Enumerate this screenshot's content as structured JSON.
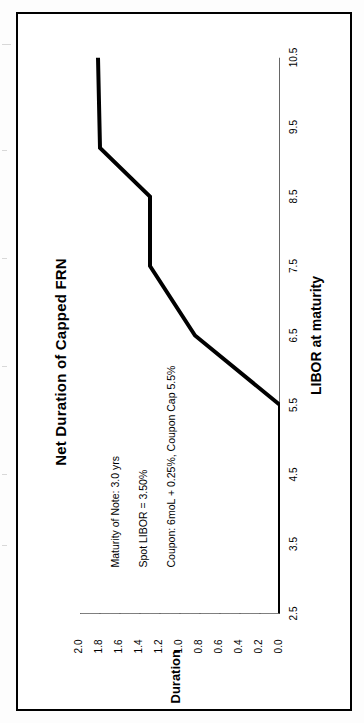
{
  "frame": {
    "border_color": "#000000",
    "background": "#ffffff"
  },
  "chart_data": {
    "type": "line",
    "title": "Net Duration of Capped FRN",
    "xlabel": "LIBOR at maturity",
    "ylabel": "Duration",
    "xlim": [
      2.5,
      10.5
    ],
    "ylim": [
      0.0,
      2.0
    ],
    "xticks": [
      "2.5",
      "3.5",
      "4.5",
      "5.5",
      "6.5",
      "7.5",
      "8.5",
      "9.5",
      "10.5"
    ],
    "yticks": [
      "0.0",
      "0.2",
      "0.4",
      "0.6",
      "0.8",
      "1.0",
      "1.2",
      "1.4",
      "1.6",
      "1.8",
      "2.0"
    ],
    "grid": false,
    "legend": "none",
    "line_color": "#000000",
    "line_width": 4,
    "series": [
      {
        "name": "Net Duration",
        "x": [
          2.5,
          5.5,
          6.5,
          7.5,
          7.5,
          8.5,
          9.2,
          10.5
        ],
        "y": [
          0.0,
          0.0,
          0.85,
          1.3,
          1.3,
          1.3,
          1.8,
          1.82
        ]
      }
    ],
    "annotations": [
      "Maturity of Note: 3.0 yrs",
      "Spot LIBOR = 3.50%",
      "Coupon: 6moL + 0.25%, Coupon Cap 5.5%"
    ]
  }
}
